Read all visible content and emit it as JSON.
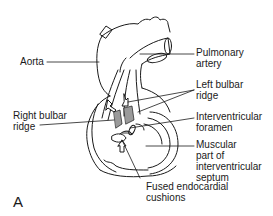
{
  "figure": {
    "panel_letter": "A",
    "labels": {
      "aorta": "Aorta",
      "pulmonary_artery_1": "Pulmonary",
      "pulmonary_artery_2": "artery",
      "left_bulbar_1": "Left bulbar",
      "left_bulbar_2": "ridge",
      "right_bulbar_1": "Right bulbar",
      "right_bulbar_2": "ridge",
      "interventricular_1": "Interventricular",
      "interventricular_2": "foramen",
      "muscular_1": "Muscular",
      "muscular_2": "part of",
      "muscular_3": "interventricular",
      "muscular_4": "septum",
      "fused_1": "Fused endocardial",
      "fused_2": "cushions"
    },
    "colors": {
      "line": "#1a1a1a",
      "ridge_shading": "#9a9a9a",
      "background": "#ffffff"
    }
  }
}
